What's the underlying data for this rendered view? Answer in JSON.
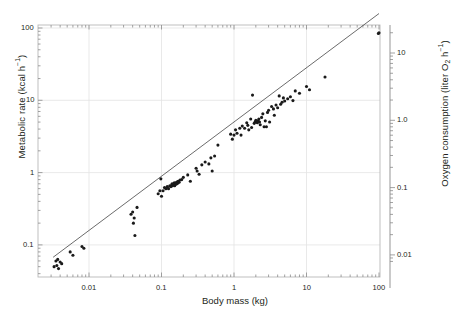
{
  "chart_data": {
    "type": "scatter",
    "title": "",
    "xlabel": "Body mass (kg)",
    "ylabel": "Metabolic rate (kcal h−1)",
    "ylabel_right": "Oxygen consumption (liter O2 h−1)",
    "xscale": "log",
    "yscale": "log",
    "xlim": [
      0.003,
      100
    ],
    "ylim": [
      0.04,
      110
    ],
    "ylim_right": [
      0.008,
      22
    ],
    "grid": true,
    "legend": null,
    "xticks": [
      0.01,
      0.1,
      1,
      10,
      100
    ],
    "xtick_labels": [
      "0.01",
      "0.1",
      "1",
      "10",
      "100"
    ],
    "yticks": [
      0.1,
      1,
      10,
      100
    ],
    "ytick_labels": [
      "0.1",
      "1",
      "10",
      "100"
    ],
    "yticks_right": [
      0.01,
      0.1,
      1.0,
      10
    ],
    "ytick_labels_right": [
      "0.01",
      "0.1",
      "1.0",
      "10"
    ],
    "fit_line": {
      "label": "allometric regression",
      "intercept_log10": 0.7,
      "slope": 0.75,
      "x_start": 0.0032,
      "x_end": 100
    },
    "points": [
      [
        0.0033,
        0.05
      ],
      [
        0.0035,
        0.06
      ],
      [
        0.0036,
        0.052
      ],
      [
        0.0037,
        0.063
      ],
      [
        0.0038,
        0.047
      ],
      [
        0.004,
        0.058
      ],
      [
        0.0042,
        0.055
      ],
      [
        0.0055,
        0.08
      ],
      [
        0.006,
        0.072
      ],
      [
        0.008,
        0.095
      ],
      [
        0.0085,
        0.09
      ],
      [
        0.038,
        0.265
      ],
      [
        0.04,
        0.285
      ],
      [
        0.041,
        0.2
      ],
      [
        0.042,
        0.235
      ],
      [
        0.043,
        0.135
      ],
      [
        0.046,
        0.33
      ],
      [
        0.09,
        0.51
      ],
      [
        0.095,
        0.56
      ],
      [
        0.098,
        0.82
      ],
      [
        0.1,
        0.47
      ],
      [
        0.105,
        0.56
      ],
      [
        0.11,
        0.62
      ],
      [
        0.115,
        0.6
      ],
      [
        0.12,
        0.64
      ],
      [
        0.125,
        0.6
      ],
      [
        0.13,
        0.655
      ],
      [
        0.135,
        0.64
      ],
      [
        0.138,
        0.67
      ],
      [
        0.14,
        0.7
      ],
      [
        0.142,
        0.66
      ],
      [
        0.145,
        0.69
      ],
      [
        0.148,
        0.7
      ],
      [
        0.15,
        0.72
      ],
      [
        0.152,
        0.66
      ],
      [
        0.155,
        0.71
      ],
      [
        0.158,
        0.69
      ],
      [
        0.16,
        0.73
      ],
      [
        0.163,
        0.7
      ],
      [
        0.165,
        0.745
      ],
      [
        0.168,
        0.72
      ],
      [
        0.17,
        0.76
      ],
      [
        0.175,
        0.735
      ],
      [
        0.18,
        0.79
      ],
      [
        0.19,
        0.8
      ],
      [
        0.2,
        0.86
      ],
      [
        0.23,
        0.93
      ],
      [
        0.25,
        0.76
      ],
      [
        0.3,
        1.15
      ],
      [
        0.31,
        1.05
      ],
      [
        0.33,
        0.95
      ],
      [
        0.36,
        1.28
      ],
      [
        0.4,
        1.4
      ],
      [
        0.45,
        1.32
      ],
      [
        0.48,
        1.6
      ],
      [
        0.5,
        1.05
      ],
      [
        0.54,
        1.7
      ],
      [
        0.6,
        2.4
      ],
      [
        0.9,
        3.4
      ],
      [
        0.95,
        2.9
      ],
      [
        1.0,
        3.3
      ],
      [
        1.05,
        3.9
      ],
      [
        1.1,
        3.5
      ],
      [
        1.2,
        4.1
      ],
      [
        1.25,
        3.3
      ],
      [
        1.3,
        4.4
      ],
      [
        1.4,
        4.1
      ],
      [
        1.5,
        4.9
      ],
      [
        1.55,
        4.5
      ],
      [
        1.6,
        3.9
      ],
      [
        1.7,
        5.5
      ],
      [
        1.75,
        4.2
      ],
      [
        1.8,
        11.8
      ],
      [
        1.9,
        4.8
      ],
      [
        1.95,
        5.0
      ],
      [
        2.0,
        5.3
      ],
      [
        2.05,
        5.1
      ],
      [
        2.1,
        4.9
      ],
      [
        2.15,
        5.2
      ],
      [
        2.2,
        5.5
      ],
      [
        2.25,
        5.0
      ],
      [
        2.3,
        4.6
      ],
      [
        2.4,
        5.8
      ],
      [
        2.5,
        6.5
      ],
      [
        2.6,
        4.3
      ],
      [
        2.7,
        5.2
      ],
      [
        2.8,
        4.3
      ],
      [
        2.9,
        6.8
      ],
      [
        3.0,
        7.3
      ],
      [
        3.1,
        5.0
      ],
      [
        3.3,
        8.2
      ],
      [
        3.5,
        7.6
      ],
      [
        3.6,
        6.2
      ],
      [
        3.8,
        8.6
      ],
      [
        4.0,
        7.9
      ],
      [
        4.2,
        11.5
      ],
      [
        4.4,
        8.8
      ],
      [
        4.6,
        9.4
      ],
      [
        4.8,
        10.8
      ],
      [
        5.0,
        9.8
      ],
      [
        5.5,
        10.5
      ],
      [
        6.0,
        11.2
      ],
      [
        6.5,
        9.9
      ],
      [
        7.0,
        13.5
      ],
      [
        8.0,
        12.5
      ],
      [
        10.0,
        15.5
      ],
      [
        11.0,
        14.0
      ],
      [
        18.0,
        21.0
      ],
      [
        98.0,
        84.0
      ],
      [
        100.0,
        86.0
      ]
    ]
  }
}
